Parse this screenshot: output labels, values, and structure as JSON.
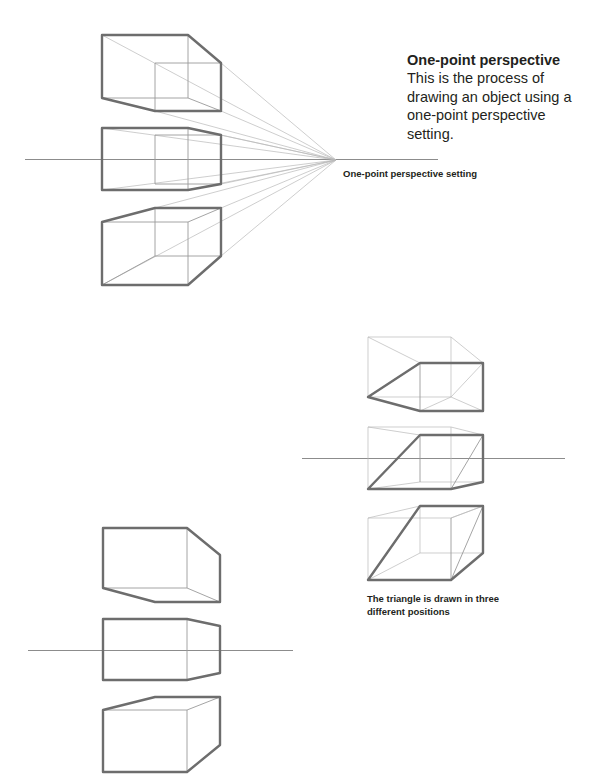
{
  "intro": {
    "title": "One-point perspective",
    "body": "This is the process of drawing an object using a one-point perspective setting."
  },
  "captions": {
    "setting": "One-point perspective setting",
    "triangle": "The triangle is drawn in three different positions"
  },
  "figures": [
    {
      "id": "one-point-setting",
      "description": "Three cubes (above, on, and below horizon) with perspective lines converging to a single vanishing point on the horizon"
    },
    {
      "id": "triangle-positions",
      "description": "Three cubes with an inclined triangular plane drawn in three different positions"
    },
    {
      "id": "cube-outlines",
      "description": "Three cube outlines above, on, and below the horizon line"
    }
  ],
  "colors": {
    "thick_line": "#6d6d6d",
    "thin_line": "#9a9a9a",
    "text": "#231f20"
  }
}
